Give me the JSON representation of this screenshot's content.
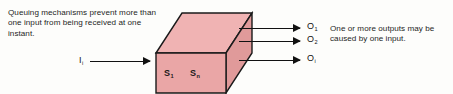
{
  "figure": {
    "type": "system-block-diagram",
    "background_color": "#fdfdfb",
    "box_fill_color": "#eaa6a6",
    "box_top_fill_color": "#f0b3b3",
    "box_side_fill_color": "#e09a9a",
    "box_stroke_color": "#1a1a1a",
    "arrow_color": "#111111",
    "text_color": "#1d1d1d"
  },
  "captions": {
    "left": "Queuing mechanisms prevent more than one input from being received at one instant.",
    "right": "One or more outputs may be caused by one input."
  },
  "box": {
    "state_labels": [
      {
        "base": "S",
        "sub": "1"
      },
      {
        "base": "S",
        "sub": "n"
      }
    ]
  },
  "input": {
    "label_base": "I",
    "label_sub": "i",
    "count": 1
  },
  "outputs": [
    {
      "label_base": "O",
      "label_sub": "1"
    },
    {
      "label_base": "O",
      "label_sub": "2"
    },
    {
      "label_base": "O",
      "label_sub": "i"
    }
  ]
}
